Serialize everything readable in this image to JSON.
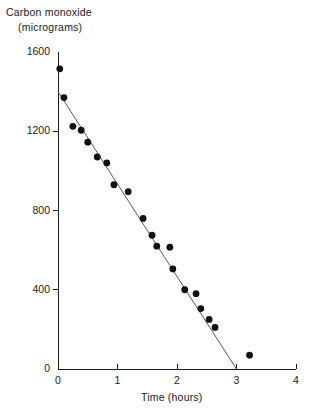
{
  "chart_data": {
    "type": "scatter",
    "title": "",
    "ylabel_lines": [
      "Carbon monoxide",
      "(micrograms)"
    ],
    "ylabel": "Carbon monoxide (micrograms)",
    "xlabel": "Time (hours)",
    "xlim": [
      0,
      4
    ],
    "ylim": [
      0,
      1600
    ],
    "xticks": [
      0,
      1,
      2,
      3,
      4
    ],
    "xtick_labels": [
      "0",
      "1",
      "2",
      "3",
      "4"
    ],
    "yticks": [
      0,
      400,
      800,
      1200,
      1600
    ],
    "ytick_labels": [
      "0",
      "400",
      "800",
      "1200",
      "1600"
    ],
    "grid": false,
    "legend": false,
    "marker": {
      "shape": "circle",
      "color": "#111111",
      "radius_px": 3.4
    },
    "trendline": {
      "present": true,
      "color": "#555555",
      "width_px": 1,
      "x": [
        0.0,
        3.0
      ],
      "y": [
        1400,
        0
      ],
      "intercept": 1400,
      "slope": -466.7
    },
    "points": [
      {
        "x": 0.03,
        "y": 1515
      },
      {
        "x": 0.1,
        "y": 1370
      },
      {
        "x": 0.25,
        "y": 1225
      },
      {
        "x": 0.39,
        "y": 1205
      },
      {
        "x": 0.5,
        "y": 1145
      },
      {
        "x": 0.66,
        "y": 1070
      },
      {
        "x": 0.82,
        "y": 1040
      },
      {
        "x": 0.94,
        "y": 930
      },
      {
        "x": 1.18,
        "y": 895
      },
      {
        "x": 1.43,
        "y": 760
      },
      {
        "x": 1.58,
        "y": 675
      },
      {
        "x": 1.66,
        "y": 620
      },
      {
        "x": 1.88,
        "y": 615
      },
      {
        "x": 1.93,
        "y": 505
      },
      {
        "x": 2.13,
        "y": 400
      },
      {
        "x": 2.32,
        "y": 380
      },
      {
        "x": 2.4,
        "y": 305
      },
      {
        "x": 2.54,
        "y": 250
      },
      {
        "x": 2.64,
        "y": 210
      },
      {
        "x": 3.22,
        "y": 70
      }
    ]
  },
  "axes_style": {
    "axis_color": "#1a1a1a",
    "axis_width_px": 1,
    "tick_length_px": 5,
    "background": "#ffffff"
  },
  "geometry": {
    "x0_px": 58,
    "x4_px": 296,
    "y0_px": 369,
    "y1600_px": 52
  }
}
